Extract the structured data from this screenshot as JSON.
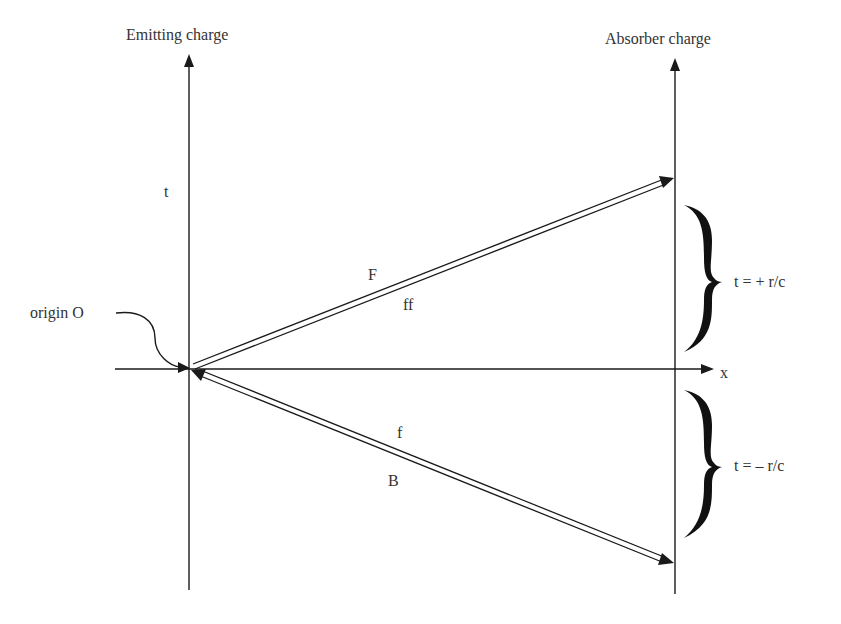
{
  "diagram": {
    "labels": {
      "emitting_charge": "Emitting charge",
      "absorber_charge": "Absorber charge",
      "t_axis": "t",
      "x_axis": "x",
      "origin": "origin O",
      "forward_upper": "F",
      "forward_lower": "ff",
      "backward_upper": "f",
      "backward_lower": "B",
      "brace_upper": "t = + r/c",
      "brace_lower": "t = – r/c"
    },
    "colors": {
      "line": "#1a1a1a",
      "text": "#333333",
      "background": "#ffffff"
    }
  }
}
